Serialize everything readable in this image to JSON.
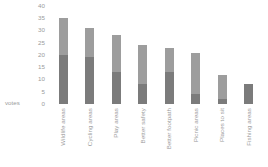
{
  "chart_data": {
    "type": "bar",
    "title": "",
    "subtitle": "",
    "xlabel": "",
    "ylabel": "votes",
    "ylim": [
      0,
      40
    ],
    "yticks": [
      40,
      35,
      30,
      25,
      20,
      15,
      10,
      5,
      0
    ],
    "grid": false,
    "legend": "none",
    "stacked": true,
    "categories": [
      "Wildlife areas",
      "Cycling areas",
      "Play areas",
      "Better safety",
      "Better footpath",
      "Picnic areas",
      "Places to sit",
      "Fishing areas"
    ],
    "values": [
      35,
      31,
      28,
      24,
      23,
      21,
      12,
      8
    ],
    "series": [
      {
        "name": "lower segment",
        "color": "#7b7b7b",
        "values": [
          20,
          19,
          13,
          8,
          13,
          4,
          2,
          8
        ]
      },
      {
        "name": "upper segment",
        "color": "#9d9d9d",
        "values": [
          15,
          12,
          15,
          16,
          10,
          17,
          10,
          0
        ]
      }
    ]
  },
  "axis": {
    "y_label": "votes",
    "y_ticks": [
      "40",
      "35",
      "30",
      "25",
      "20",
      "15",
      "10",
      "5",
      "0"
    ]
  },
  "colors": {
    "background": "#ffffff",
    "text": "#9b9b9b",
    "segment_upper": "#9d9d9d",
    "segment_lower": "#7b7b7b"
  }
}
